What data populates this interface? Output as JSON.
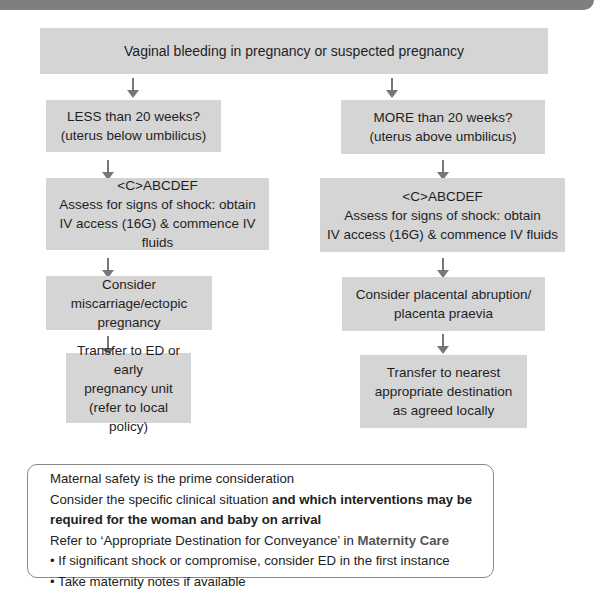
{
  "colors": {
    "banner": "#7f7f7f",
    "box_fill": "#d5d5d5",
    "arrow": "#777777",
    "note_border": "#8a8a8a",
    "accent_text": "#555555"
  },
  "flowchart": {
    "root": "Vaginal bleeding in pregnancy or suspected pregnancy",
    "left": {
      "question": "LESS than 20 weeks?\n(uterus below umbilicus)",
      "assess": "<C>ABCDEF\nAssess for signs of shock: obtain\nIV access (16G) & commence IV fluids",
      "consider": "Consider miscarriage/ectopic\npregnancy",
      "transfer": "Transfer to ED or early\npregnancy unit\n(refer to local policy)"
    },
    "right": {
      "question": "MORE than 20 weeks?\n(uterus above umbilicus)",
      "assess": "<C>ABCDEF\nAssess for signs of shock: obtain\nIV access (16G) & commence IV fluids",
      "consider": "Consider placental abruption/\nplacenta praevia",
      "transfer": "Transfer to nearest\nappropriate destination\nas agreed locally"
    }
  },
  "note": {
    "line1": "Maternal safety is the prime consideration",
    "line2_plain": "Consider the specific clinical situation ",
    "line2_bold": "and which interventions may be required for the woman and baby on arrival",
    "line3_plain": "Refer to ‘Appropriate Destination for Conveyance’ in ",
    "line3_accent": "Maternity Care",
    "bullets": [
      "• If significant shock or compromise, consider ED in the first instance",
      "• Take maternity notes if available"
    ]
  }
}
